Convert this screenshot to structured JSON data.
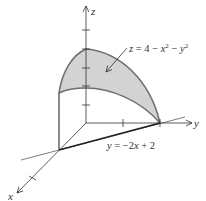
{
  "diagram": {
    "axes": {
      "x_label": "x",
      "y_label": "y",
      "z_label": "z"
    },
    "surface_label": {
      "lhs": "z",
      "eq": " = 4 − ",
      "x": "x",
      "x_exp": "2",
      "minus": " − ",
      "y": "y",
      "y_exp": "2"
    },
    "line_label": {
      "lhs": "y",
      "eq": " = −2",
      "x": "x",
      "rest": " + 2"
    },
    "colors": {
      "surface_fill": "#d3d3d3",
      "surface_edge": "#707070",
      "axis": "#333333",
      "bold_line": "#222222"
    }
  }
}
